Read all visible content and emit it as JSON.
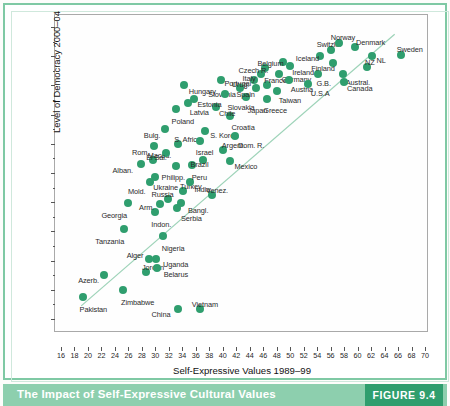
{
  "caption": {
    "title": "The Impact of Self-Expressive Cultural Values",
    "figure_number": "FIGURE 9.4"
  },
  "colors": {
    "dot": "#2f9e6e",
    "band": "#8dcfae",
    "figure_box": "#2f9e6e",
    "frame": "#7fc9a4",
    "trend_line": "#9dd3b8"
  },
  "chart_data": {
    "type": "scatter",
    "title": "",
    "xlabel": "Self-Expressive Values 1989–99",
    "ylabel": "Level of Democracy 2000–04",
    "xlim": [
      16,
      70
    ],
    "ylim": [
      0.0,
      1.0
    ],
    "grid": false,
    "legend": "none",
    "xticks": [
      16,
      18,
      20,
      22,
      24,
      26,
      28,
      30,
      32,
      34,
      36,
      38,
      40,
      42,
      44,
      46,
      48,
      50,
      52,
      54,
      56,
      58,
      60,
      62,
      64,
      66,
      68,
      70
    ],
    "yticks": [
      "0.00",
      "0.10",
      "0.20",
      "0.30",
      "0.40",
      "0.50",
      "0.60",
      "0.70",
      "0.80",
      "0.90",
      "1.00"
    ],
    "ytick_values": [
      0.0,
      0.1,
      0.2,
      0.3,
      0.4,
      0.5,
      0.6,
      0.7,
      0.8,
      0.9,
      1.0
    ],
    "yminor_values": [
      0.05,
      0.15,
      0.25,
      0.35,
      0.45,
      0.55,
      0.65,
      0.75,
      0.85,
      0.95
    ],
    "trend_line": {
      "x0": 19.0,
      "y0": 0.045,
      "x1": 65.5,
      "y1": 0.975
    },
    "points": [
      {
        "label": "Pakistan",
        "x": 19.2,
        "y": 0.075,
        "lx": -3,
        "ly": 9
      },
      {
        "label": "Zimbabwe",
        "x": 25.2,
        "y": 0.098,
        "lx": -2,
        "ly": 9
      },
      {
        "label": "China",
        "x": 33.3,
        "y": 0.035,
        "lx": -26,
        "ly": 2
      },
      {
        "label": "Vietnam",
        "x": 36.6,
        "y": 0.035,
        "lx": -8,
        "ly": -8
      },
      {
        "label": "Azerb.",
        "x": 22.4,
        "y": 0.15,
        "lx": -26,
        "ly": 2
      },
      {
        "label": "Jordan",
        "x": 28.6,
        "y": 0.16,
        "lx": -4,
        "ly": -8
      },
      {
        "label": "Belarus",
        "x": 30.2,
        "y": 0.175,
        "lx": 7,
        "ly": 3
      },
      {
        "label": "Uganda",
        "x": 30.1,
        "y": 0.207,
        "lx": 7,
        "ly": 2
      },
      {
        "label": "Alger",
        "x": 29.0,
        "y": 0.207,
        "lx": -22,
        "ly": -7
      },
      {
        "label": "Nigeria",
        "x": 31.1,
        "y": 0.285,
        "lx": -1,
        "ly": 9
      },
      {
        "label": "Tanzania",
        "x": 25.4,
        "y": 0.307,
        "lx": -29,
        "ly": 9
      },
      {
        "label": "Georgia",
        "x": 26.0,
        "y": 0.398,
        "lx": -27,
        "ly": 9
      },
      {
        "label": "Indon.",
        "x": 30.0,
        "y": 0.368,
        "lx": -4,
        "ly": 9
      },
      {
        "label": "Serbia",
        "x": 33.2,
        "y": 0.38,
        "lx": 4,
        "ly": 7
      },
      {
        "label": "Arm.",
        "x": 30.7,
        "y": 0.395,
        "lx": -21,
        "ly": 0
      },
      {
        "label": "Russia",
        "x": 31.8,
        "y": 0.412,
        "lx": -16,
        "ly": -8
      },
      {
        "label": "Bangl.",
        "x": 33.8,
        "y": 0.398,
        "lx": 7,
        "ly": 4
      },
      {
        "label": "Turkey",
        "x": 34.1,
        "y": 0.438,
        "lx": -3,
        "ly": -8
      },
      {
        "label": "Venez.",
        "x": 38.4,
        "y": 0.425,
        "lx": -6,
        "ly": -8
      },
      {
        "label": "Mold.",
        "x": 29.2,
        "y": 0.468,
        "lx": -22,
        "ly": 6
      },
      {
        "label": "Ukraine",
        "x": 30.0,
        "y": 0.487,
        "lx": -2,
        "ly": 7
      },
      {
        "label": "Maced.",
        "x": 29.6,
        "y": 0.543,
        "lx": -5,
        "ly": -8
      },
      {
        "label": "Alban.",
        "x": 27.8,
        "y": 0.53,
        "lx": -28,
        "ly": 3
      },
      {
        "label": "India",
        "x": 35.2,
        "y": 0.47,
        "lx": 4,
        "ly": 4
      },
      {
        "label": "Philipp.",
        "x": 33.0,
        "y": 0.525,
        "lx": -14,
        "ly": 8
      },
      {
        "label": "Peru",
        "x": 35.4,
        "y": 0.527,
        "lx": 0,
        "ly": 9
      },
      {
        "label": "Brazil",
        "x": 37.0,
        "y": 0.545,
        "lx": -12,
        "ly": 1
      },
      {
        "label": "Mexico",
        "x": 41.0,
        "y": 0.54,
        "lx": 5,
        "ly": 2
      },
      {
        "label": "Argent.",
        "x": 40.0,
        "y": 0.578,
        "lx": -1,
        "ly": -8
      },
      {
        "label": "El Sal.",
        "x": 31.6,
        "y": 0.57,
        "lx": -20,
        "ly": 1
      },
      {
        "label": "S. Africa",
        "x": 33.4,
        "y": 0.6,
        "lx": -4,
        "ly": -8
      },
      {
        "label": "Rom.",
        "x": 29.8,
        "y": 0.592,
        "lx": -22,
        "ly": 3
      },
      {
        "label": "Bulg.",
        "x": 31.4,
        "y": 0.65,
        "lx": -21,
        "ly": 3
      },
      {
        "label": "Israel",
        "x": 36.6,
        "y": 0.61,
        "lx": -4,
        "ly": 8
      },
      {
        "label": "S. Korea",
        "x": 37.4,
        "y": 0.645,
        "lx": 5,
        "ly": 1
      },
      {
        "label": "Dom. R.",
        "x": 41.8,
        "y": 0.628,
        "lx": 3,
        "ly": 6
      },
      {
        "label": "Croatia",
        "x": 41.0,
        "y": 0.695,
        "lx": 2,
        "ly": 8
      },
      {
        "label": "Chile",
        "x": 39.0,
        "y": 0.725,
        "lx": 3,
        "ly": 3
      },
      {
        "label": "Poland",
        "x": 33.0,
        "y": 0.718,
        "lx": -4,
        "ly": 9
      },
      {
        "label": "Latvia",
        "x": 34.8,
        "y": 0.74,
        "lx": 2,
        "ly": 6
      },
      {
        "label": "Estonia",
        "x": 35.8,
        "y": 0.755,
        "lx": 3,
        "ly": 2
      },
      {
        "label": "Hungary",
        "x": 34.2,
        "y": 0.8,
        "lx": 5,
        "ly": 3
      },
      {
        "label": "Portugal",
        "x": 39.8,
        "y": 0.82,
        "lx": 3,
        "ly": 0
      },
      {
        "label": "Slovenia",
        "x": 42.6,
        "y": 0.79,
        "lx": -32,
        "ly": 3
      },
      {
        "label": "Slovakia",
        "x": 40.4,
        "y": 0.77,
        "lx": 2,
        "ly": 10
      },
      {
        "label": "Japan",
        "x": 43.4,
        "y": 0.76,
        "lx": 2,
        "ly": 10
      },
      {
        "label": "Spain",
        "x": 45.0,
        "y": 0.79,
        "lx": -20,
        "ly": 3
      },
      {
        "label": "Urug.",
        "x": 44.6,
        "y": 0.818,
        "lx": -22,
        "ly": 1
      },
      {
        "label": "Greece",
        "x": 46.6,
        "y": 0.752,
        "lx": -4,
        "ly": 8
      },
      {
        "label": "France",
        "x": 46.6,
        "y": 0.8,
        "lx": -3,
        "ly": -8
      },
      {
        "label": "Taiwan",
        "x": 48.0,
        "y": 0.782,
        "lx": 2,
        "ly": 6
      },
      {
        "label": "Italy",
        "x": 45.6,
        "y": 0.84,
        "lx": -18,
        "ly": 1
      },
      {
        "label": "Czech R.",
        "x": 46.2,
        "y": 0.86,
        "lx": -26,
        "ly": -1
      },
      {
        "label": "Germany",
        "x": 48.4,
        "y": 0.838,
        "lx": 2,
        "ly": 2
      },
      {
        "label": "Austria",
        "x": 49.8,
        "y": 0.82,
        "lx": 2,
        "ly": 6
      },
      {
        "label": "Belgium",
        "x": 49.0,
        "y": 0.88,
        "lx": -26,
        "ly": -2
      },
      {
        "label": "Ireland",
        "x": 50.0,
        "y": 0.868,
        "lx": 2,
        "ly": 3
      },
      {
        "label": "U.S.A",
        "x": 52.6,
        "y": 0.805,
        "lx": 3,
        "ly": 6
      },
      {
        "label": "G.B.",
        "x": 54.2,
        "y": 0.838,
        "lx": -2,
        "ly": 6
      },
      {
        "label": "Iceland",
        "x": 54.4,
        "y": 0.9,
        "lx": -24,
        "ly": -1
      },
      {
        "label": "Switzld.",
        "x": 56.0,
        "y": 0.92,
        "lx": -14,
        "ly": -9
      },
      {
        "label": "Finland",
        "x": 56.4,
        "y": 0.878,
        "lx": -22,
        "ly": 2
      },
      {
        "label": "Norway",
        "x": 57.2,
        "y": 0.945,
        "lx": -8,
        "ly": -9
      },
      {
        "label": "Denmark",
        "x": 59.6,
        "y": 0.93,
        "lx": 1,
        "ly": -8
      },
      {
        "label": "Austral.",
        "x": 57.8,
        "y": 0.84,
        "lx": 3,
        "ly": 5
      },
      {
        "label": "Canada",
        "x": 58.0,
        "y": 0.812,
        "lx": 3,
        "ly": 3
      },
      {
        "label": "NZ",
        "x": 61.4,
        "y": 0.862,
        "lx": -2,
        "ly": -8
      },
      {
        "label": "NL",
        "x": 62.2,
        "y": 0.9,
        "lx": 4,
        "ly": 1
      },
      {
        "label": "Sweden",
        "x": 66.4,
        "y": 0.905,
        "lx": -4,
        "ly": -9
      }
    ]
  }
}
